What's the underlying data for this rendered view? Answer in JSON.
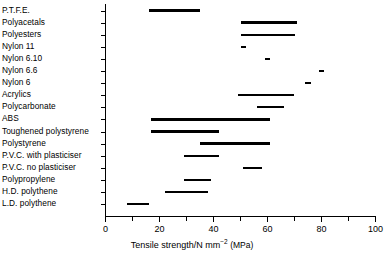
{
  "chart_data": {
    "type": "bar",
    "orientation": "horizontal-range",
    "title": "",
    "xlabel": "Tensile strength/N mm−2 (MPa)",
    "ylabel": "",
    "xlim": [
      0,
      100
    ],
    "xticks": [
      0,
      20,
      40,
      60,
      80,
      100
    ],
    "xtick_labels": [
      "0",
      "20",
      "40",
      "60",
      "80",
      "100"
    ],
    "minor_tick_step": 10,
    "grid": false,
    "legend": false,
    "categories": [
      "P.T.F.E.",
      "Polyacetals",
      "Polyesters",
      "Nylon 11",
      "Nylon 6.10",
      "Nylon 6.6",
      "Nylon 6",
      "Acrylics",
      "Polycarbonate",
      "ABS",
      "Toughened polystyrene",
      "Polystyrene",
      "P.V.C. with plasticiser",
      "P.V.C. no plasticiser",
      "Polypropylene",
      "H.D. polythene",
      "L.D. polythene"
    ],
    "ranges": [
      [
        16,
        35
      ],
      [
        50,
        71
      ],
      [
        50,
        70
      ],
      [
        50,
        52
      ],
      [
        59,
        61
      ],
      [
        79,
        81
      ],
      [
        74,
        76
      ],
      [
        49,
        70
      ],
      [
        56,
        66
      ],
      [
        17,
        61
      ],
      [
        17,
        42
      ],
      [
        35,
        61
      ],
      [
        29,
        42
      ],
      [
        51,
        58
      ],
      [
        29,
        39
      ],
      [
        22,
        38
      ],
      [
        8,
        16
      ]
    ],
    "series": [
      {
        "name": "Tensile strength range (min)",
        "values": [
          16,
          50,
          50,
          50,
          59,
          79,
          74,
          49,
          56,
          17,
          17,
          35,
          29,
          51,
          29,
          22,
          8
        ]
      },
      {
        "name": "Tensile strength range (max)",
        "values": [
          35,
          71,
          70,
          52,
          61,
          81,
          76,
          70,
          66,
          61,
          42,
          61,
          42,
          58,
          39,
          38,
          16
        ]
      }
    ]
  },
  "axis": {
    "x_title_main": "Tensile strength/N mm",
    "x_title_exponent": "−2",
    "x_title_paren": "(MPa)"
  },
  "colors": {
    "bar": "#000000",
    "axis": "#000000",
    "background": "#ffffff",
    "text": "#000000"
  }
}
